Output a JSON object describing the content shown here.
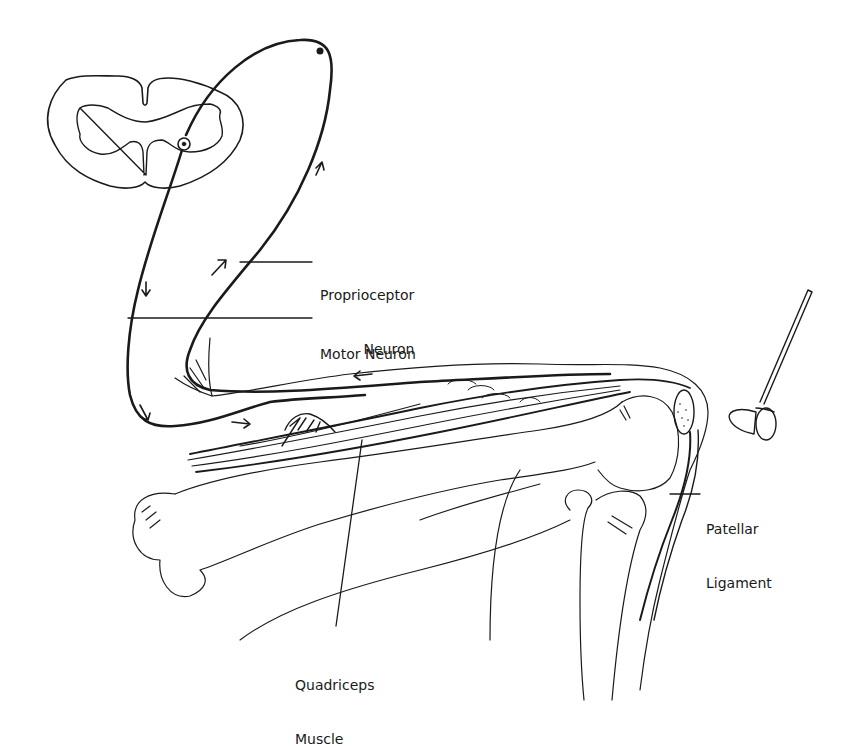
{
  "diagram": {
    "labels": {
      "proprioceptor": {
        "line1": "Proprioceptor",
        "line2": "Neuron"
      },
      "motor": {
        "line1": "Motor Neuron"
      },
      "patellar": {
        "line1": "Patellar",
        "line2": "Ligament"
      },
      "quadriceps": {
        "line1": "Quadriceps",
        "line2": "Muscle"
      }
    },
    "icons": [
      "spinal-cord-cross-section",
      "reflex-hammer",
      "direction-arrow"
    ],
    "colors": {
      "ink": "#1a1a1a",
      "background": "#ffffff"
    }
  }
}
